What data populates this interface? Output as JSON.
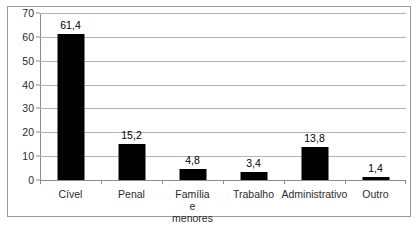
{
  "chart_data": {
    "type": "bar",
    "title": "",
    "subtitle": "",
    "xlabel": "",
    "ylabel": "",
    "categories": [
      "Cível",
      "Penal",
      "Família e\nmenores",
      "Trabalho",
      "Administrativo",
      "Outro"
    ],
    "values": [
      61.4,
      15.2,
      4.8,
      3.4,
      13.8,
      1.4
    ],
    "value_labels": [
      "61,4",
      "15,2",
      "4,8",
      "3,4",
      "13,8",
      "1,4"
    ],
    "ylim": [
      0,
      70
    ],
    "ytick_values": [
      0,
      10,
      20,
      30,
      40,
      50,
      60,
      70
    ],
    "ytick_labels": [
      "0",
      "10",
      "20",
      "30",
      "40",
      "50",
      "60",
      "70"
    ],
    "grid": "horizontal",
    "legend": "none",
    "bar_color": "#000000",
    "gridline_color": "#b4b4b4",
    "axis_color": "#8c8c8c",
    "background_color": "#ffffff",
    "border_color": "#9a9a9a",
    "decimal_separator": ","
  }
}
